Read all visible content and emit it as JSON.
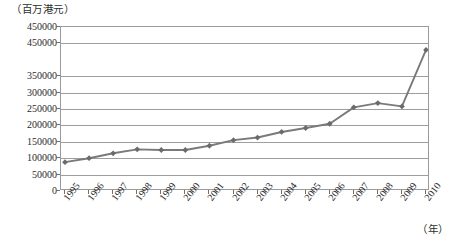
{
  "chart_data": {
    "type": "line",
    "title": "",
    "ylabel": "（百万港元）",
    "xlabel": "（年）",
    "categories": [
      "1995",
      "1996",
      "1997",
      "1998",
      "1999",
      "2000",
      "2001",
      "2002",
      "2003",
      "2004",
      "2005",
      "2006",
      "2007",
      "2008",
      "2009",
      "2010"
    ],
    "series": [
      {
        "name": "",
        "values": [
          88000,
          100000,
          115000,
          127000,
          125000,
          125000,
          138000,
          155000,
          163000,
          180000,
          192000,
          205000,
          255000,
          268000,
          258000,
          430000
        ]
      }
    ],
    "ytick_labels": [
      "450000",
      "450000",
      "350000",
      "300000",
      "250000",
      "200000",
      "150000",
      "100000",
      "50000",
      "0"
    ],
    "ytick_values": [
      500000,
      450000,
      350000,
      300000,
      250000,
      200000,
      150000,
      100000,
      50000,
      0
    ],
    "ylim": [
      0,
      500000
    ],
    "ytick_step": 50000,
    "grid": true,
    "gridlines": 11,
    "legend": "none",
    "marker": "diamond",
    "line_color": "#7a7a7a",
    "marker_color": "#6b6b6b",
    "grid_color": "#9e9e9e",
    "axis_color": "#9a9a9a",
    "xlabel_rotation": -52
  },
  "axes": {
    "y_unit_caption": "（百万港元）",
    "x_unit_caption": "（年）"
  }
}
